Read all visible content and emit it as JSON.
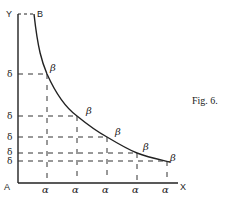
{
  "figure": {
    "caption": "Fig. 6.",
    "axis_labels": {
      "y": "Y",
      "x": "X",
      "origin": "A",
      "top": "B"
    },
    "point_label": "β",
    "y_tick_label": "δ",
    "x_tick_label": "α",
    "points": [
      {
        "x": 47,
        "y": 74
      },
      {
        "x": 77,
        "y": 116
      },
      {
        "x": 107,
        "y": 137
      },
      {
        "x": 137,
        "y": 153
      },
      {
        "x": 167,
        "y": 161
      }
    ],
    "beta_labels": [
      "β",
      "β",
      "β",
      "β",
      "β"
    ],
    "delta_labels": [
      "δ",
      "δ",
      "δ",
      "δ",
      "δ"
    ],
    "alpha_labels": [
      "α",
      "α",
      "α",
      "α",
      "α"
    ]
  }
}
